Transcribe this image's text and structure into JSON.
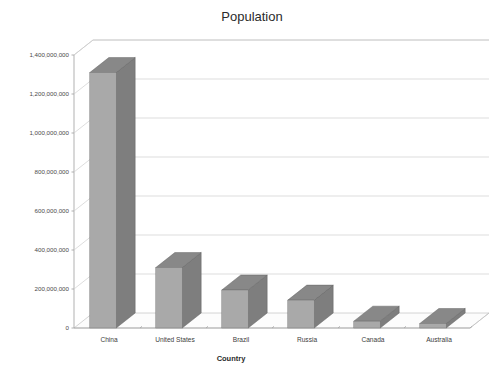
{
  "chart_data": {
    "type": "bar",
    "title": "Population",
    "subtitle": "",
    "xlabel": "Country",
    "ylabel": "",
    "categories": [
      "China",
      "United States",
      "Brazil",
      "Russia",
      "Canada",
      "Australia"
    ],
    "values": [
      1310000000,
      310000000,
      195000000,
      143000000,
      35000000,
      23000000
    ],
    "series": [
      {
        "name": "Population",
        "values": [
          1310000000,
          310000000,
          195000000,
          143000000,
          35000000,
          23000000
        ]
      }
    ],
    "ylim": [
      0,
      1400000000
    ],
    "ytick_values": [
      0,
      200000000,
      400000000,
      600000000,
      800000000,
      1000000000,
      1200000000,
      1400000000
    ],
    "ytick_labels": [
      "0",
      "200,000,000",
      "400,000,000",
      "600,000,000",
      "800,000,000",
      "1,000,000,000",
      "1,200,000,000",
      "1,400,000,000"
    ],
    "grid": true,
    "legend": false,
    "legend_position": "none",
    "projection": "3d",
    "style": {
      "background": "#ffffff",
      "bar_front_color": "#a9a9a9",
      "bar_side_color": "#7e7e7e",
      "bar_top_color": "#888888",
      "gridline_color": "#cfcfcf",
      "axis_color": "#a8a8a8",
      "text_color": "#3a3a3a"
    }
  },
  "labels": {
    "title": "Population",
    "xaxis_title": "Country",
    "ytick_0": "0",
    "ytick_1": "200,000,000",
    "ytick_2": "400,000,000",
    "ytick_3": "600,000,000",
    "ytick_4": "800,000,000",
    "ytick_5": "1,000,000,000",
    "ytick_6": "1,200,000,000",
    "ytick_7": "1,400,000,000",
    "cat_0": "China",
    "cat_1": "United States",
    "cat_2": "Brazil",
    "cat_3": "Russia",
    "cat_4": "Canada",
    "cat_5": "Australia"
  }
}
